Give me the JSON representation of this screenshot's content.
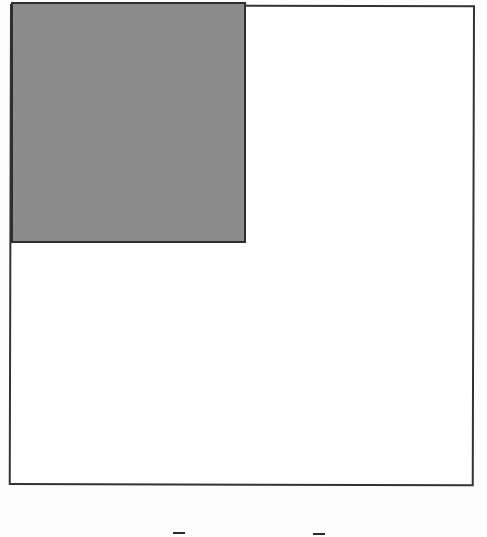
{
  "diagram": {
    "type": "unit-square-area-model",
    "outer_square": {
      "stroke": "#333333",
      "fill": "#ffffff"
    },
    "shaded_region": {
      "position": "top-left",
      "fraction_of_width": "1/2",
      "fraction_of_height": "1/2",
      "fill": "#8c8c8c",
      "stroke": "#2e2e2e"
    },
    "bottom_marks": [
      {
        "glyph": "–"
      },
      {
        "glyph": "–"
      }
    ]
  }
}
